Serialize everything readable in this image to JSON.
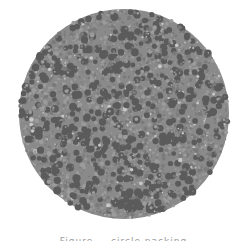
{
  "figure": {
    "type": "circle-packing",
    "caption": "Figure — circle packing",
    "canvas": {
      "width": 247,
      "height": 241,
      "background": "#ffffff"
    },
    "enclosing_circle": {
      "cx": 124,
      "cy": 114,
      "r": 105,
      "fill": "#8a8a8a"
    },
    "palette": {
      "dark": "#5b5b5b",
      "mid": "#7a7a7a",
      "light": "#9c9c9c",
      "highlight": "#c8c8c8"
    },
    "packing": {
      "seed": 7,
      "count": 2600,
      "min_radius": 0.8,
      "max_radius": 4.2
    }
  }
}
